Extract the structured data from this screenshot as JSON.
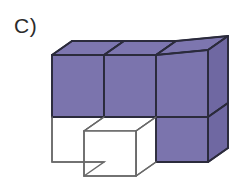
{
  "figure": {
    "label": "C)",
    "label_name": "figure-label-c",
    "background_color": "#ffffff"
  },
  "colors": {
    "purple_front": "#7b74ad",
    "purple_top": "#7d76af",
    "purple_side": "#6f68a2",
    "white_face": "#ffffff",
    "outline": "#2b2b3c",
    "outline_light": "#5a5a5a",
    "label_text": "#2b2b2b",
    "background": "#ffffff"
  },
  "geometry": {
    "projection": "isometric-oblique",
    "cube_width": 52,
    "cube_height": 45,
    "depth_dx": 20,
    "depth_dy": -14,
    "origin_x": 52,
    "origin_y": 55,
    "columns": 3,
    "rows": 2
  },
  "cubes": [
    {
      "id": "cube-top-left",
      "color": "purple",
      "col": 0,
      "row": 0
    },
    {
      "id": "cube-top-middle",
      "color": "purple",
      "col": 1,
      "row": 0
    },
    {
      "id": "cube-top-right",
      "color": "purple",
      "col": 2,
      "row": 0
    },
    {
      "id": "cube-bottom-left",
      "color": "white",
      "col": 0,
      "row": 1
    },
    {
      "id": "cube-bottom-front",
      "color": "white",
      "col": 1,
      "row": 1
    },
    {
      "id": "cube-bottom-right",
      "color": "purple",
      "col": 2,
      "row": 1
    }
  ],
  "counts": {
    "purple_cubes": 4,
    "white_cubes": 2,
    "total_visible": 6
  }
}
